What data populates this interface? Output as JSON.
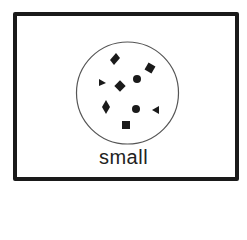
{
  "diagram": {
    "label": "small",
    "colors": {
      "frame": "#1a1a1a",
      "shapes": "#1a1a1a",
      "circle": "#555555",
      "background": "#ffffff"
    },
    "circle": {
      "cx": 127.5,
      "cy": 93,
      "r": 51
    },
    "shapes": [
      {
        "type": "diamond",
        "x": 115,
        "y": 59
      },
      {
        "type": "rotated-square",
        "x": 150,
        "y": 68
      },
      {
        "type": "triangle-right",
        "x": 102,
        "y": 82
      },
      {
        "type": "rotated-square",
        "x": 120,
        "y": 86
      },
      {
        "type": "dot",
        "x": 137,
        "y": 79
      },
      {
        "type": "diamond",
        "x": 106,
        "y": 107
      },
      {
        "type": "dot",
        "x": 136,
        "y": 109
      },
      {
        "type": "triangle-left",
        "x": 156,
        "y": 110
      },
      {
        "type": "square",
        "x": 126,
        "y": 125
      }
    ]
  }
}
